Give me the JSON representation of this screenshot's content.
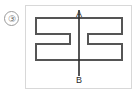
{
  "figure": {
    "number_label": "③",
    "axis": {
      "top_label": "A",
      "bottom_label": "B"
    },
    "shape": {
      "name": "i-beam-cross-section",
      "description": "H-shaped (I-beam) profile split by vertical axis A-B",
      "outline_color": "#555555",
      "outline_width": 2,
      "fill": "#ffffff",
      "points": "10,12 96,12 96,28 62,28 62,38 96,38 96,54 10,54 10,38 44,38 44,28 10,28"
    },
    "axis_line": {
      "color": "#2b2b2b",
      "width": 1.6,
      "x": 53,
      "y1": 4,
      "y2": 70
    },
    "frame_color": "#d8d8d8",
    "number_circle_color": "#9a9a9a",
    "background": "#ffffff"
  }
}
